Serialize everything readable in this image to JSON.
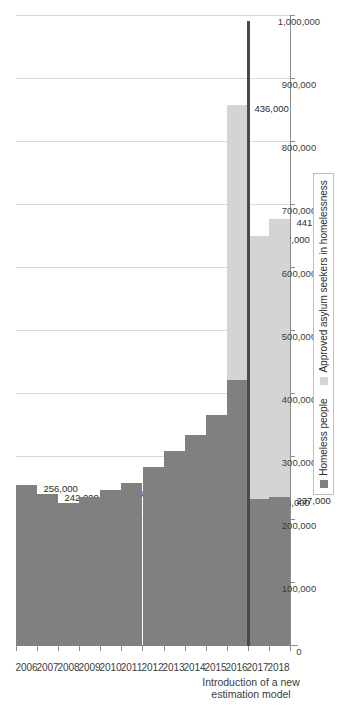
{
  "chart_data": {
    "type": "bar",
    "orientation": "vertical-rendered-sideways",
    "stacked": true,
    "title": "",
    "xlabel": "",
    "ylabel": "",
    "categories": [
      "2006",
      "2007",
      "2008",
      "2009",
      "2010",
      "2011",
      "2012",
      "2013",
      "2014",
      "2015",
      "2016",
      "2017",
      "2018"
    ],
    "series": [
      {
        "name": "Homeless people",
        "color": "#808080",
        "values": [
          256000,
          242000,
          227000,
          237000,
          248000,
          258000,
          284000,
          310000,
          335000,
          367000,
          422000,
          234000,
          237000
        ],
        "labels": [
          "256,000",
          "242,000",
          "227,000",
          "237,000",
          "248,000",
          "258,000",
          "284,000",
          "310,000",
          "335,000",
          "367,000",
          "422,000",
          "234,000",
          "237,000"
        ]
      },
      {
        "name": "Approved asylum seekers in homelessness",
        "color": "#d4d4d4",
        "values": [
          0,
          0,
          0,
          0,
          0,
          0,
          0,
          0,
          0,
          0,
          436000,
          417000,
          441000
        ],
        "labels": [
          "",
          "",
          "",
          "",
          "",
          "",
          "",
          "",
          "",
          "",
          "436,000",
          "417,000",
          "441,000"
        ]
      }
    ],
    "ylim": [
      0,
      1000000
    ],
    "tick_values": [
      0,
      100000,
      200000,
      300000,
      400000,
      500000,
      600000,
      700000,
      800000,
      900000,
      1000000
    ],
    "tick_labels": [
      "0",
      "100,000",
      "200,000",
      "300,000",
      "400,000",
      "500,000",
      "600,000",
      "700,000",
      "800,000",
      "900,000",
      "1,000,000"
    ],
    "grid": true,
    "legend_position": "bottom-right",
    "annotations": [
      {
        "text_line1": "Introduction of a new",
        "text_line2": "estimation model",
        "between_categories": [
          "2016",
          "2017"
        ]
      }
    ]
  },
  "legend": {
    "items": [
      {
        "label": "Homeless people",
        "color": "#808080",
        "swatch": "square-dark"
      },
      {
        "label": "Approved asylum seekers in homelessness",
        "color": "#d4d4d4",
        "swatch": "square-light"
      }
    ]
  },
  "annotation": {
    "line1": "Introduction of a new",
    "line2": "estimation model"
  }
}
